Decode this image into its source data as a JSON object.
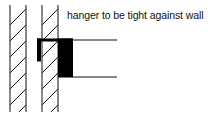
{
  "diagram": {
    "annotation": "hanger to be tight against wall",
    "elements": [
      "left-wall-hatched",
      "right-wall-hatched",
      "hanger-bracket",
      "joist-box"
    ],
    "colors": {
      "line": "#111111",
      "fill": "#000000",
      "background": "#ffffff"
    }
  }
}
